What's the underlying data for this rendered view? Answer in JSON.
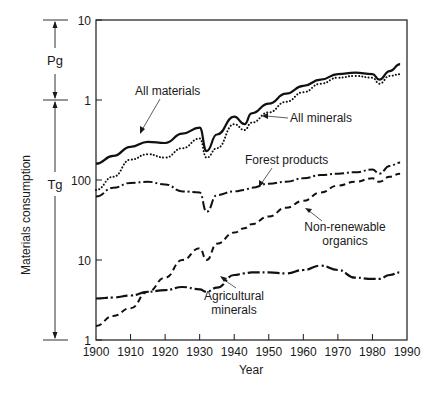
{
  "chart_data": {
    "type": "line",
    "title": "",
    "xlabel": "Year",
    "ylabel": "Materials consumption",
    "yscale": "log",
    "xlim": [
      1900,
      1990
    ],
    "ylim_tg": [
      1,
      10000
    ],
    "x_ticks": [
      "1900",
      "1910",
      "1920",
      "1930",
      "1940",
      "1950",
      "1960",
      "1970",
      "1980",
      "1990"
    ],
    "y_ticks": [
      {
        "label": "10",
        "value_tg": 10000
      },
      {
        "label": "1",
        "value_tg": 1000
      },
      {
        "label": "100",
        "value_tg": 100
      },
      {
        "label": "10",
        "value_tg": 10
      },
      {
        "label": "1",
        "value_tg": 1
      }
    ],
    "unit_brackets": [
      {
        "label": "Pg",
        "from_tg": 1000,
        "to_tg": 10000
      },
      {
        "label": "Tg",
        "from_tg": 1,
        "to_tg": 1000
      }
    ],
    "grid": false,
    "legend": "inline annotations with arrows",
    "x": [
      1900,
      1905,
      1910,
      1915,
      1920,
      1925,
      1930,
      1932,
      1935,
      1940,
      1943,
      1945,
      1950,
      1955,
      1960,
      1965,
      1970,
      1975,
      1980,
      1982,
      1985,
      1988
    ],
    "series": [
      {
        "name": "All materials",
        "style": "solid",
        "values": [
          160,
          200,
          260,
          300,
          290,
          380,
          450,
          230,
          370,
          620,
          500,
          680,
          900,
          1200,
          1500,
          1800,
          2100,
          2200,
          2100,
          1800,
          2300,
          2800
        ]
      },
      {
        "name": "All minerals",
        "style": "dotted",
        "values": [
          75,
          110,
          180,
          210,
          190,
          250,
          330,
          190,
          250,
          500,
          420,
          520,
          700,
          950,
          1250,
          1600,
          1900,
          2000,
          1900,
          1600,
          2000,
          2100
        ]
      },
      {
        "name": "Forest products",
        "style": "dash-dot",
        "values": [
          62,
          80,
          92,
          95,
          88,
          72,
          70,
          40,
          65,
          72,
          75,
          80,
          90,
          95,
          105,
          115,
          120,
          125,
          135,
          120,
          150,
          165
        ]
      },
      {
        "name": "Non-renewable organics",
        "style": "dashed",
        "values": [
          1.5,
          2,
          2.5,
          4,
          6,
          10,
          14,
          10,
          16,
          22,
          25,
          28,
          35,
          45,
          55,
          70,
          85,
          95,
          105,
          95,
          110,
          120
        ]
      },
      {
        "name": "Agricultural minerals",
        "style": "dash-dot-long",
        "values": [
          3.3,
          3.4,
          3.6,
          4,
          4.2,
          4.6,
          4.3,
          4,
          4.5,
          6.5,
          6.8,
          7,
          7,
          6.8,
          7.5,
          8.5,
          7.5,
          6,
          5.8,
          5.8,
          6.5,
          7
        ]
      }
    ],
    "annotations": [
      {
        "text": "All materials",
        "x_year": 1918,
        "y_tg": 1000
      },
      {
        "text": "All minerals",
        "x_year": 1955,
        "y_tg": 480
      },
      {
        "text": "Forest products",
        "x_year": 1949,
        "y_tg": 135
      },
      {
        "text": [
          "Non-renewable",
          "organics"
        ],
        "x_year": 1970,
        "y_tg": 25
      },
      {
        "text": [
          "Agricultural",
          "minerals"
        ],
        "x_year": 1945,
        "y_tg": 3.5
      }
    ]
  },
  "labels": {
    "ylabel": "Materials consumption",
    "xlabel": "Year",
    "pg": "Pg",
    "tg": "Tg",
    "all_materials": "All materials",
    "all_minerals": "All minerals",
    "forest_products": "Forest products",
    "nonrenew_1": "Non-renewable",
    "nonrenew_2": "organics",
    "agri_1": "Agricultural",
    "agri_2": "minerals"
  }
}
